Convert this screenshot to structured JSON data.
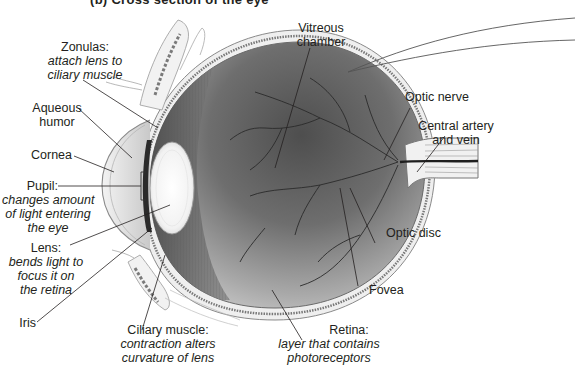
{
  "figure": {
    "title_partial": "(b) Cross section of the eye",
    "colors": {
      "background": "#ffffff",
      "text": "#231f20",
      "leader_line": "#231f20",
      "vitreous_dark": "#5a5a5a",
      "vitreous_light": "#c8c8c8",
      "sclera": "#e6e6e6",
      "lens": "#f4f4f4",
      "vessel": "#2b2b2b"
    }
  },
  "labels": {
    "zonulas": {
      "term": "Zonulas:",
      "desc_lines": [
        "attach lens to",
        "ciliary muscle"
      ]
    },
    "aqueous_humor": {
      "term_lines": [
        "Aqueous",
        "humor"
      ]
    },
    "cornea": {
      "term": "Cornea"
    },
    "pupil": {
      "term": "Pupil:",
      "desc_lines": [
        "changes amount",
        "of light entering",
        "the eye"
      ]
    },
    "lens": {
      "term": "Lens:",
      "desc_lines": [
        "bends light to",
        "focus it on",
        "the retina"
      ]
    },
    "iris": {
      "term": "Iris"
    },
    "ciliary_muscle": {
      "term": "Ciliary muscle:",
      "desc_lines": [
        "contraction alters",
        "curvature of lens"
      ]
    },
    "retina": {
      "term": "Retina:",
      "desc_lines": [
        "layer that contains",
        "photoreceptors"
      ]
    },
    "fovea": {
      "term": "Fovea"
    },
    "optic_disc": {
      "term": "Optic disc"
    },
    "central_artery": {
      "term_lines": [
        "Central artery",
        "and vein"
      ]
    },
    "optic_nerve": {
      "term": "Optic nerve"
    },
    "vitreous_chamber": {
      "term_lines": [
        "Vitreous",
        "chamber"
      ]
    }
  }
}
